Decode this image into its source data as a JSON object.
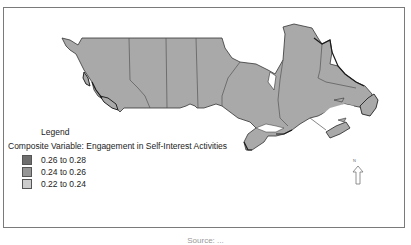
{
  "map": {
    "subject": "Canada provinces choropleth",
    "fill_color": "#a8a8a8",
    "border_color": "#666666",
    "coast_color": "#222222"
  },
  "legend": {
    "title": "Legend",
    "variable": "Composite Variable: Engagement in Self-Interest Activities",
    "items": [
      {
        "label": "0.26 to 0.28",
        "color": "#6e6e6e"
      },
      {
        "label": "0.24 to 0.26",
        "color": "#969696"
      },
      {
        "label": "0.22 to 0.24",
        "color": "#cccccc"
      }
    ]
  },
  "north_arrow": {
    "label": "N",
    "icon": "north-arrow-icon"
  },
  "caption": {
    "text": "Source: ..."
  }
}
